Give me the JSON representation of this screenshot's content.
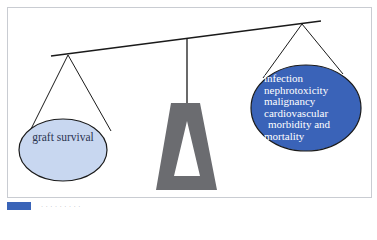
{
  "diagram": {
    "type": "balance-scale",
    "left_pan": {
      "label": "graft survival",
      "fill": "#c8d7f0",
      "text_color": "#2b3550"
    },
    "right_pan": {
      "lines": [
        "infection",
        "nephrotoxicity",
        "malignancy",
        "cardiovascular",
        "morbidity and",
        "mortality"
      ],
      "fill": "#3a63b8",
      "text_color": "#ffffff"
    },
    "fulcrum_color": "#6b6c70",
    "beam_color": "#1a1a1a",
    "caption": {
      "tag_color": "#3a64b8",
      "text": "· · · · · · · · ·"
    }
  }
}
